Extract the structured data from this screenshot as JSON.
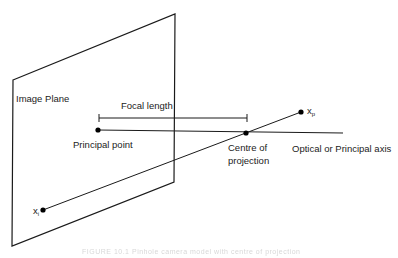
{
  "diagram": {
    "type": "pinhole-camera-projection",
    "labels": {
      "image_plane": "Image Plane",
      "focal_length": "Focal length",
      "principal_point": "Principal point",
      "centre_of_projection_line1": "Centre of",
      "centre_of_projection_line2": "projection",
      "optical_axis": "Optical or Principal axis",
      "point_image_base": "x",
      "point_image_sub": "i",
      "point_world_base": "x",
      "point_world_sub": "p"
    },
    "caption": "FIGURE 10.1 Pinhole camera model with centre of projection",
    "colors": {
      "line": "#1a1a1a",
      "point": "#000000",
      "background": "#ffffff"
    }
  }
}
